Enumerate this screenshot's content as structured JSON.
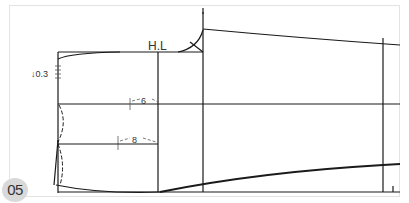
{
  "figure": {
    "step_number": "05",
    "labels": {
      "hip_line": "H.L",
      "offset_top": "↓0.3",
      "measure_upper": "6",
      "measure_lower": "8"
    },
    "colors": {
      "line": "#1a1a1a",
      "frame": "#e3e3e3",
      "badge_bg": "#d9d9d9",
      "badge_text": "#333333"
    }
  }
}
